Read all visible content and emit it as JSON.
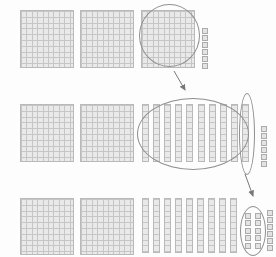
{
  "figure": {
    "type": "base-ten-blocks-regrouping-diagram",
    "colors": {
      "background": "#fdfdfd",
      "block_fill": "#e9e9e9",
      "block_grid_line": "#c6c6c6",
      "block_border": "#b9b9b9",
      "cube_fill": "#e3e3e3",
      "cube_border": "#ababab",
      "highlight_stroke": "#8f8f8f",
      "arrow": "#787878"
    },
    "rows": [
      {
        "id": "top-row",
        "hundreds": 3,
        "tens": 0,
        "ones": 6,
        "ones_circled": 0,
        "annotations": [
          "circle-around-third-hundred-block",
          "arrow-pointing-to-middle-row"
        ]
      },
      {
        "id": "middle-row",
        "hundreds": 2,
        "tens": 10,
        "ones": 6,
        "ones_circled": 0,
        "annotations": [
          "large-oval-around-ten-tens-rods",
          "narrow-oval-around-last-tens-rod",
          "arrow-pointing-to-bottom-row"
        ]
      },
      {
        "id": "bottom-row",
        "hundreds": 2,
        "tens": 9,
        "ones": 16,
        "ones_circled": 10,
        "annotations": [
          "oval-around-ten-regrouped-ones"
        ]
      }
    ],
    "arrows": [
      {
        "id": "arrow-hundred-to-tens",
        "from_row": "top-row",
        "to_row": "middle-row"
      },
      {
        "id": "arrow-ten-to-ones",
        "from_row": "middle-row",
        "to_row": "bottom-row"
      }
    ]
  }
}
